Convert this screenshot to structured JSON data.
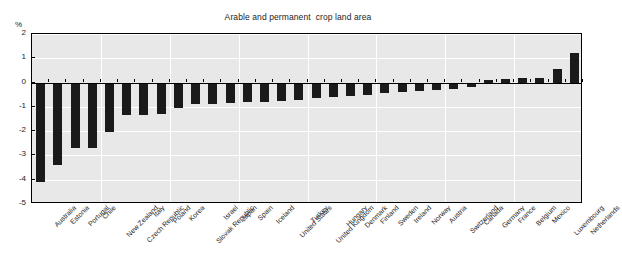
{
  "chart_data": {
    "type": "bar",
    "title": "Arable and permanent  crop land area",
    "xlabel": "",
    "ylabel": "%",
    "ylim": [
      -5,
      2
    ],
    "yticks": [
      2,
      1,
      0,
      -1,
      -2,
      -3,
      -4,
      -5
    ],
    "ytick_labels": [
      "2",
      "1",
      "0",
      "-1",
      "-2",
      "-3",
      "-4",
      "-5"
    ],
    "grid": true,
    "legend": "none",
    "bar_color": "#1a1a1a",
    "plot_background": "#e8e8e8",
    "categories": [
      "Australia",
      "Estonia",
      "Portugal",
      "Chile",
      "New Zealand",
      "Czech Republic",
      "Italy",
      "Poland",
      "Korea",
      "Slovak Republic",
      "Israel",
      "Japan",
      "Spain",
      "Iceland",
      "United States",
      "Turkey",
      "United Kingdom",
      "Hungary",
      "Denmark",
      "Finland",
      "Sweden",
      "Ireland",
      "Norway",
      "Austria",
      "Switzerland",
      "Canada",
      "Germany",
      "France",
      "Belgium",
      "Mexico",
      "Luxembourg",
      "Netherlands"
    ],
    "values": [
      -4.1,
      -3.4,
      -2.7,
      -2.7,
      -2.05,
      -1.35,
      -1.35,
      -1.3,
      -1.05,
      -0.9,
      -0.9,
      -0.85,
      -0.8,
      -0.8,
      -0.75,
      -0.7,
      -0.65,
      -0.6,
      -0.55,
      -0.5,
      -0.45,
      -0.4,
      -0.35,
      -0.3,
      -0.25,
      -0.2,
      0.1,
      0.15,
      0.2,
      0.2,
      0.55,
      1.2
    ]
  }
}
